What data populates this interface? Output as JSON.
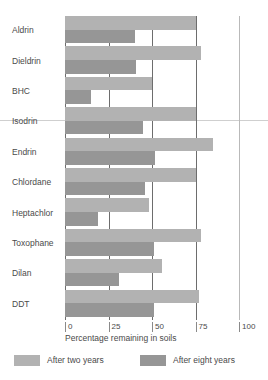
{
  "chart_data": {
    "type": "bar",
    "orientation": "horizontal",
    "title": "",
    "xlabel": "Percentage remaining in soils",
    "ylabel": "",
    "xlim": [
      0,
      100
    ],
    "xticks": [
      0,
      25,
      50,
      75,
      100
    ],
    "xtick_labels": [
      "0",
      "25",
      "50",
      "75",
      "100"
    ],
    "grid": true,
    "legend_position": "bottom",
    "categories": [
      "Aldrin",
      "Dieldrin",
      "BHC",
      "Isodrin",
      "Endrin",
      "Chlordane",
      "Heptachlor",
      "Toxophane",
      "Dilan",
      "DDT"
    ],
    "series": [
      {
        "name": "After two years",
        "color": "#b2b2b2",
        "values": [
          75,
          78,
          50,
          75,
          85,
          75,
          48,
          78,
          56,
          77
        ]
      },
      {
        "name": "After eight years",
        "color": "#969696",
        "values": [
          40,
          41,
          15,
          45,
          52,
          46,
          19,
          51,
          31,
          51
        ]
      }
    ]
  },
  "axis": {
    "xlabel": "Percentage remaining in soils"
  },
  "legend": {
    "items": [
      {
        "label": "After two years",
        "color": "#b2b2b2"
      },
      {
        "label": "After eight years",
        "color": "#969696"
      }
    ]
  },
  "colors": {
    "two_years": "#b2b2b2",
    "eight_years": "#969696",
    "gridline": "#6d6d6d",
    "gridline_faint": "#b9b9b9",
    "text": "#4a4a4a"
  }
}
